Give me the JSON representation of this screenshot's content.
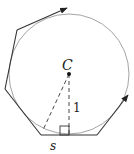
{
  "diagram": {
    "labels": {
      "center": "C",
      "radius": "1",
      "side": "s"
    },
    "colors": {
      "polygon": "#333333",
      "circle": "#9a9a9a",
      "dashed": "#333333"
    },
    "shapes": {
      "circle": {
        "cx": 69,
        "cy": 74,
        "r": 60
      },
      "polygon_edges": [
        [
          [
            67,
            8
          ],
          [
            17,
            30
          ]
        ],
        [
          [
            17,
            30
          ],
          [
            5,
            89
          ]
        ],
        [
          [
            5,
            89
          ],
          [
            41,
            135
          ]
        ],
        [
          [
            41,
            135
          ],
          [
            97,
            135
          ]
        ],
        [
          [
            97,
            135
          ],
          [
            128,
            95
          ]
        ]
      ],
      "arrows": [
        "top-edge",
        "right-edge"
      ],
      "right_angle_marker": {
        "x": 60,
        "y": 126,
        "size": 9
      }
    }
  }
}
